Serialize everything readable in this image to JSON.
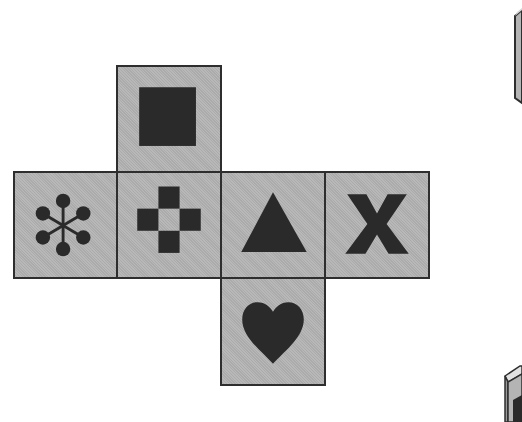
{
  "diagram": {
    "type": "cube-net",
    "colors": {
      "face_fill": "#b4b4b4",
      "face_border": "#2e2e2e",
      "symbol": "#2a2a2a",
      "background": "#ffffff"
    },
    "faces": [
      {
        "id": "top",
        "symbol": "filled-square",
        "row": 0,
        "col": 1
      },
      {
        "id": "left",
        "symbol": "asterisk-dots",
        "row": 1,
        "col": 0
      },
      {
        "id": "center-left",
        "symbol": "four-square-cross",
        "row": 1,
        "col": 1
      },
      {
        "id": "center-right",
        "symbol": "triangle",
        "row": 1,
        "col": 2
      },
      {
        "id": "right",
        "symbol": "x-letter",
        "row": 1,
        "col": 3
      },
      {
        "id": "bottom",
        "symbol": "heart",
        "row": 2,
        "col": 2
      }
    ],
    "partial_objects": [
      {
        "id": "cube-option-top-right",
        "position": "top-right, cropped"
      },
      {
        "id": "cube-option-bottom-right",
        "position": "bottom-right, cropped"
      }
    ]
  }
}
